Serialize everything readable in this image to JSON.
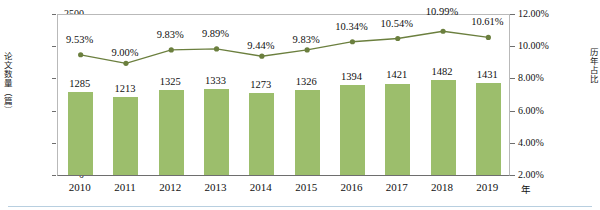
{
  "chart_data": {
    "type": "bar",
    "title": "",
    "subtitle": "",
    "xlabel": "年",
    "categories": [
      "2010",
      "2011",
      "2012",
      "2013",
      "2014",
      "2015",
      "2016",
      "2017",
      "2018",
      "2019"
    ],
    "grid": false,
    "legend": "none",
    "series": [
      {
        "name": "论文数量（篇）",
        "type": "bar",
        "axis": "left",
        "values": [
          1285,
          1213,
          1325,
          1333,
          1273,
          1326,
          1394,
          1421,
          1482,
          1431
        ],
        "labels": [
          "1285",
          "1213",
          "1325",
          "1333",
          "1273",
          "1326",
          "1394",
          "1421",
          "1482",
          "1431"
        ],
        "color": "#9cbe6c"
      },
      {
        "name": "历年占比",
        "type": "line",
        "axis": "right",
        "values": [
          9.53,
          9.0,
          9.83,
          9.89,
          9.44,
          9.83,
          10.34,
          10.54,
          10.99,
          10.61
        ],
        "labels": [
          "9.53%",
          "9.00%",
          "9.83%",
          "9.89%",
          "9.44%",
          "9.83%",
          "10.34%",
          "10.54%",
          "10.99%",
          "10.61%"
        ],
        "color": "#6b7f3e"
      }
    ],
    "axes": {
      "left": {
        "title": "论文数量（篇）",
        "ylim": [
          0,
          2500
        ],
        "tick_step": 500,
        "ticks": [
          0,
          500,
          1000,
          1500,
          2000,
          2500
        ],
        "tick_labels": [
          "0",
          "500",
          "1000",
          "1500",
          "2000",
          "2500"
        ]
      },
      "right": {
        "title": "历年占比",
        "ylim": [
          2.0,
          12.0
        ],
        "tick_step": 2.0,
        "ticks": [
          2.0,
          4.0,
          6.0,
          8.0,
          10.0,
          12.0
        ],
        "tick_labels": [
          "2.00%",
          "4.00%",
          "6.00%",
          "8.00%",
          "10.00%",
          "12.00%"
        ]
      },
      "x": {
        "unit_label": "年",
        "tick_labels": [
          "2010",
          "2011",
          "2012",
          "2013",
          "2014",
          "2015",
          "2016",
          "2017",
          "2018",
          "2019"
        ]
      }
    }
  }
}
